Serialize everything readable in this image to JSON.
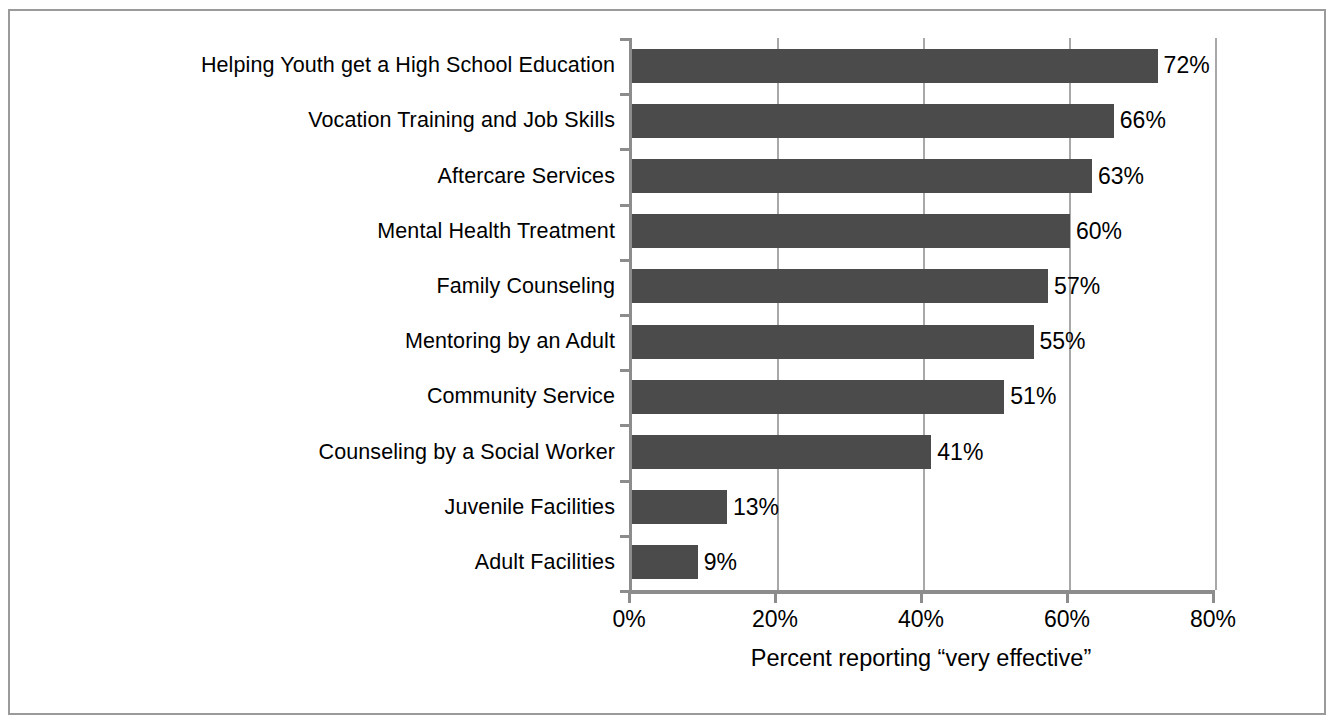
{
  "chart_data": {
    "type": "bar",
    "orientation": "horizontal",
    "title": "",
    "xlabel": "Percent reporting “very effective”",
    "ylabel": "",
    "xlim": [
      0,
      80
    ],
    "grid": true,
    "legend": null,
    "xticks": [
      0,
      20,
      40,
      60,
      80
    ],
    "xtick_labels": [
      "0%",
      "20%",
      "40%",
      "60%",
      "80%"
    ],
    "bar_color": "#4b4b4b",
    "categories": [
      "Helping Youth get a High School Education",
      "Vocation Training and Job Skills",
      "Aftercare Services",
      "Mental Health Treatment",
      "Family Counseling",
      "Mentoring by an Adult",
      "Community Service",
      "Counseling by a Social Worker",
      "Juvenile Facilities",
      "Adult Facilities"
    ],
    "values": [
      72,
      66,
      63,
      60,
      57,
      55,
      51,
      41,
      13,
      9
    ],
    "value_labels": [
      "72%",
      "66%",
      "63%",
      "60%",
      "57%",
      "55%",
      "51%",
      "41%",
      "13%",
      "9%"
    ]
  },
  "axis": {
    "x_title": "Percent reporting “very effective”"
  },
  "style": {
    "frame_color": "#9a9a9a",
    "gridline_color": "#a8a8a8",
    "axis_color": "#8c8c8c",
    "bar_color": "#4b4b4b",
    "text_color": "#000000",
    "background": "#ffffff"
  }
}
